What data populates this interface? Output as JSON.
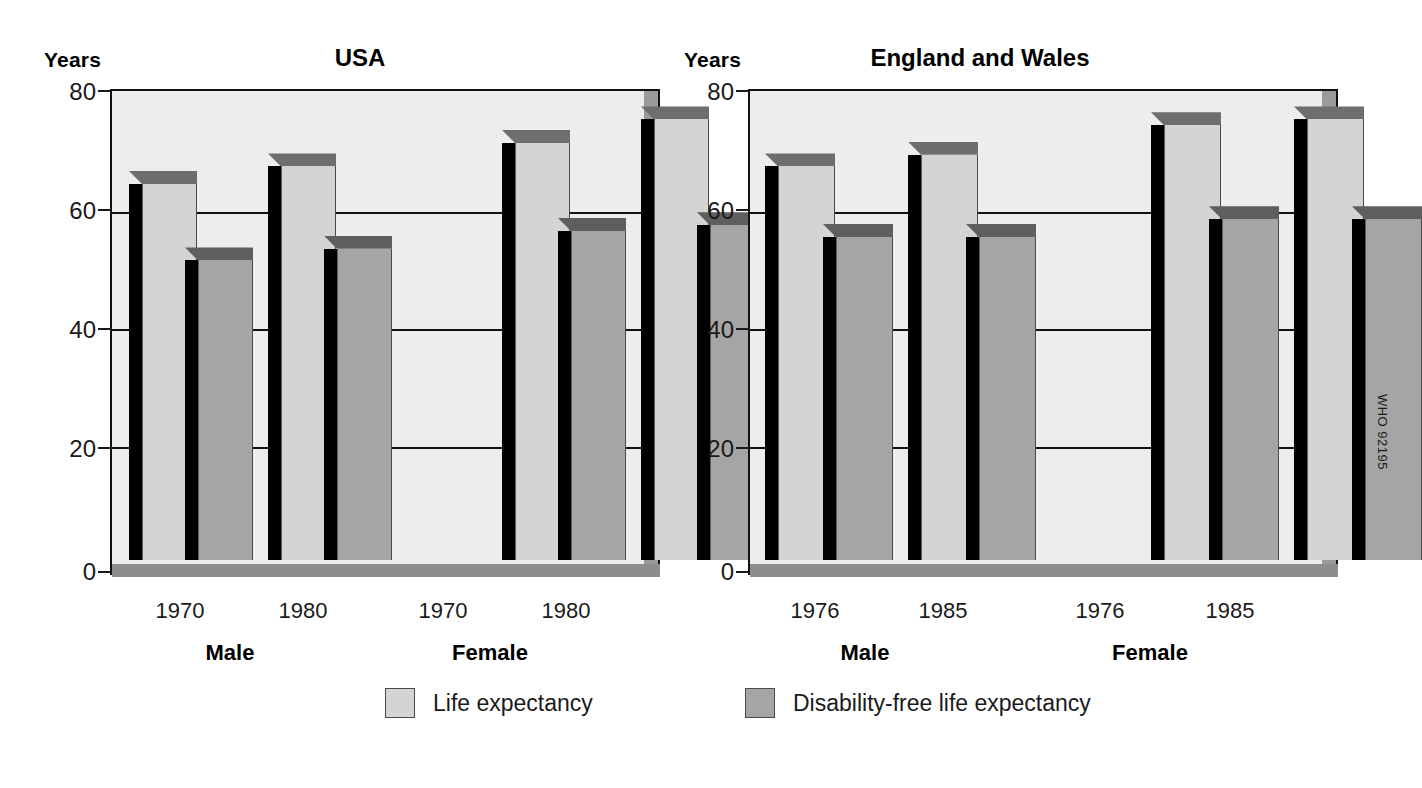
{
  "figure": {
    "source_code": "WHO 92195",
    "y_axis_caption": "Years"
  },
  "legend": {
    "position": "bottom-center",
    "items": [
      {
        "label": "Life expectancy",
        "key": "le",
        "color": "#d4d4d4"
      },
      {
        "label": "Disability-free life expectancy",
        "key": "dfle",
        "color": "#a5a5a5"
      }
    ]
  },
  "chart_data": [
    {
      "type": "bar",
      "title": "USA",
      "xlabel": "",
      "ylabel": "Years",
      "ylim": [
        0,
        80
      ],
      "yticks": [
        0,
        20,
        40,
        60,
        80
      ],
      "grid": true,
      "groups": [
        "Male",
        "Female"
      ],
      "categories": [
        "1970",
        "1980",
        "1970",
        "1980"
      ],
      "group_of_category": [
        "Male",
        "Male",
        "Female",
        "Female"
      ],
      "series": [
        {
          "name": "Life expectancy",
          "values": [
            64,
            67,
            71,
            75
          ]
        },
        {
          "name": "Disability-free life expectancy",
          "values": [
            51,
            53,
            56,
            57
          ]
        }
      ]
    },
    {
      "type": "bar",
      "title": "England and Wales",
      "xlabel": "",
      "ylabel": "Years",
      "ylim": [
        0,
        80
      ],
      "yticks": [
        0,
        20,
        40,
        60,
        80
      ],
      "grid": true,
      "groups": [
        "Male",
        "Female"
      ],
      "categories": [
        "1976",
        "1985",
        "1976",
        "1985"
      ],
      "group_of_category": [
        "Male",
        "Male",
        "Female",
        "Female"
      ],
      "series": [
        {
          "name": "Life expectancy",
          "values": [
            67,
            69,
            74,
            75
          ]
        },
        {
          "name": "Disability-free life expectancy",
          "values": [
            55,
            55,
            58,
            58
          ]
        }
      ]
    }
  ],
  "panels": {
    "usa": {
      "title": "USA",
      "years_label": "Years",
      "yticks": [
        "80",
        "60",
        "40",
        "20",
        "0"
      ],
      "xticks": [
        "1970",
        "1980",
        "1970",
        "1980"
      ],
      "group_labels": [
        "Male",
        "Female"
      ]
    },
    "england_wales": {
      "title": "England and Wales",
      "years_label": "Years",
      "yticks": [
        "80",
        "60",
        "40",
        "20",
        "0"
      ],
      "xticks": [
        "1976",
        "1985",
        "1976",
        "1985"
      ],
      "group_labels": [
        "Male",
        "Female"
      ]
    }
  }
}
